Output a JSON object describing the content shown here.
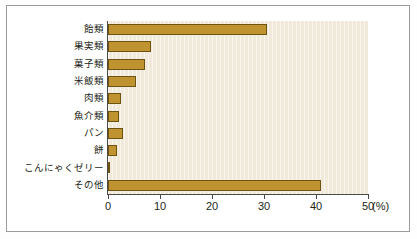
{
  "chart_data": {
    "type": "bar",
    "orientation": "horizontal",
    "title": "",
    "xlabel": "(%)",
    "ylabel": "",
    "xlim": [
      0,
      50
    ],
    "xticks": [
      0,
      10,
      20,
      30,
      40,
      50
    ],
    "xtick_labels": [
      "0",
      "10",
      "20",
      "30",
      "40",
      "50"
    ],
    "grid": false,
    "legend": false,
    "categories": [
      "飴類",
      "果実類",
      "菓子類",
      "米飯類",
      "肉類",
      "魚介類",
      "パン",
      "餅",
      "こんにゃくゼリー",
      "その他"
    ],
    "values": [
      30.6,
      8.3,
      7.2,
      5.4,
      2.5,
      2.1,
      2.9,
      1.7,
      0.4,
      40.9
    ],
    "unit": "%"
  },
  "style": {
    "bar_fill": "#bf9430",
    "bar_edge": "#6e5412",
    "plot_background": "#f1eada",
    "page_background": "#ffffff",
    "frame_border": "#9b9b9b",
    "axis_color": "#4a4a4a",
    "text_color": "#231f20"
  },
  "axis": {
    "unit_suffix": "(%)"
  }
}
